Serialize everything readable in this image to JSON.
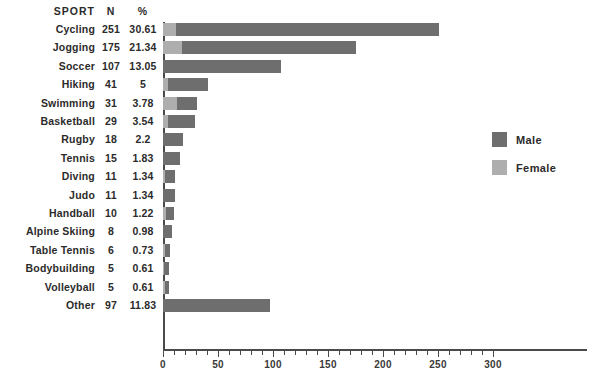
{
  "table_headers": {
    "sport": "SPORT",
    "n": "N",
    "pct": "%"
  },
  "legend": {
    "position": "right",
    "items": [
      {
        "label": "Male",
        "color": "#6e6e6e"
      },
      {
        "label": "Female",
        "color": "#aeaeae"
      }
    ]
  },
  "axis": {
    "xlabel": "",
    "ylabel": "",
    "xlim": [
      0,
      300
    ],
    "major_ticks": [
      0,
      50,
      100,
      150,
      200,
      250,
      300
    ],
    "minor_step": 10,
    "tick_labels": [
      "0",
      "50",
      "100",
      "150",
      "200",
      "250",
      "300"
    ],
    "grid": false
  },
  "chart_data": {
    "type": "bar",
    "orientation": "horizontal",
    "stacked": true,
    "title": "",
    "xlabel": "",
    "ylabel": "",
    "xlim": [
      0,
      300
    ],
    "grid": false,
    "legend_position": "right",
    "categories": [
      "Cycling",
      "Jogging",
      "Soccer",
      "Hiking",
      "Swimming",
      "Basketball",
      "Rugby",
      "Tennis",
      "Diving",
      "Judo",
      "Handball",
      "Alpine Skiing",
      "Table Tennis",
      "Bodybuilding",
      "Volleyball",
      "Other"
    ],
    "series": [
      {
        "name": "Female",
        "color": "#aeaeae",
        "values": [
          12,
          17,
          0,
          5,
          13,
          5,
          0,
          0,
          2,
          0,
          3,
          0,
          2,
          1,
          2,
          0
        ]
      },
      {
        "name": "Male",
        "color": "#6e6e6e",
        "values": [
          239,
          158,
          107,
          36,
          18,
          24,
          18,
          15,
          9,
          11,
          7,
          8,
          4,
          4,
          3,
          97
        ]
      }
    ],
    "totals": [
      251,
      175,
      107,
      41,
      31,
      29,
      18,
      15,
      11,
      11,
      10,
      8,
      6,
      5,
      5,
      97
    ],
    "percent": [
      "30.61",
      "21.34",
      "13.05",
      "5",
      "3.78",
      "3.54",
      "2.2",
      "1.83",
      "1.34",
      "1.34",
      "1.22",
      "0.98",
      "0.73",
      "0.61",
      "0.61",
      "11.83"
    ]
  },
  "rows": [
    {
      "sport": "Cycling",
      "n": "251",
      "pct": "30.61"
    },
    {
      "sport": "Jogging",
      "n": "175",
      "pct": "21.34"
    },
    {
      "sport": "Soccer",
      "n": "107",
      "pct": "13.05"
    },
    {
      "sport": "Hiking",
      "n": "41",
      "pct": "5"
    },
    {
      "sport": "Swimming",
      "n": "31",
      "pct": "3.78"
    },
    {
      "sport": "Basketball",
      "n": "29",
      "pct": "3.54"
    },
    {
      "sport": "Rugby",
      "n": "18",
      "pct": "2.2"
    },
    {
      "sport": "Tennis",
      "n": "15",
      "pct": "1.83"
    },
    {
      "sport": "Diving",
      "n": "11",
      "pct": "1.34"
    },
    {
      "sport": "Judo",
      "n": "11",
      "pct": "1.34"
    },
    {
      "sport": "Handball",
      "n": "10",
      "pct": "1.22"
    },
    {
      "sport": "Alpine Skiing",
      "n": "8",
      "pct": "0.98"
    },
    {
      "sport": "Table Tennis",
      "n": "6",
      "pct": "0.73"
    },
    {
      "sport": "Bodybuilding",
      "n": "5",
      "pct": "0.61"
    },
    {
      "sport": "Volleyball",
      "n": "5",
      "pct": "0.61"
    },
    {
      "sport": "Other",
      "n": "97",
      "pct": "11.83"
    }
  ]
}
